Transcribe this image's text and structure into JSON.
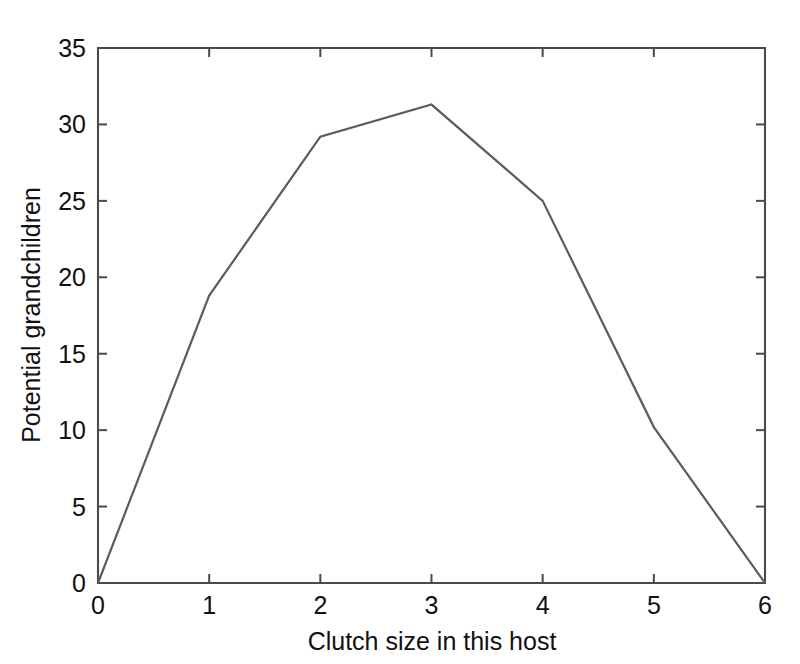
{
  "chart_data": {
    "type": "line",
    "title": "",
    "xlabel": "Clutch size in this host",
    "ylabel": "Potential grandchildren",
    "xlim": [
      0,
      6
    ],
    "ylim": [
      0,
      35
    ],
    "xticks": [
      0,
      1,
      2,
      3,
      4,
      5,
      6
    ],
    "xtick_labels": [
      "0",
      "1",
      "2",
      "3",
      "4",
      "5",
      "6"
    ],
    "yticks": [
      0,
      5,
      10,
      15,
      20,
      25,
      30,
      35
    ],
    "ytick_labels": [
      "0",
      "5",
      "10",
      "15",
      "20",
      "25",
      "30",
      "35"
    ],
    "grid": false,
    "legend": null,
    "series": [
      {
        "name": "Potential grandchildren",
        "color": "#5c5c5c",
        "x": [
          0,
          1,
          2,
          3,
          4,
          5,
          6
        ],
        "values": [
          0,
          18.8,
          29.2,
          31.3,
          25.0,
          10.2,
          0
        ]
      }
    ],
    "annotations": []
  },
  "figure": {
    "background_color": "#ffffff",
    "axes_color": "#4a4a4a",
    "text_color": "#111111",
    "box_frame": true,
    "tick_direction": "in"
  }
}
